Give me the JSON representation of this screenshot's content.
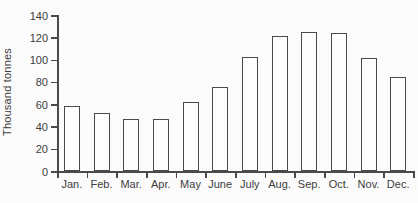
{
  "chart_data": {
    "type": "bar",
    "title": "",
    "xlabel": "",
    "ylabel": "Thousand tonnes",
    "categories": [
      "Jan.",
      "Feb.",
      "Mar.",
      "Apr.",
      "May",
      "June",
      "July",
      "Aug.",
      "Sep.",
      "Oct.",
      "Nov.",
      "Dec."
    ],
    "values": [
      58,
      52,
      47,
      47,
      62,
      75,
      102,
      121,
      125,
      124,
      101,
      84
    ],
    "ylim": [
      0,
      140
    ],
    "y_ticks": [
      0,
      20,
      40,
      60,
      80,
      100,
      120,
      140
    ],
    "grid": false,
    "legend_position": "none",
    "bar_fill_color": "#fdfdfd",
    "bar_outline_color": "#4a4a4a",
    "axis_color": "#4a4a4a",
    "text_color": "#3d3d3d",
    "background_color": "#fbfbfb"
  }
}
